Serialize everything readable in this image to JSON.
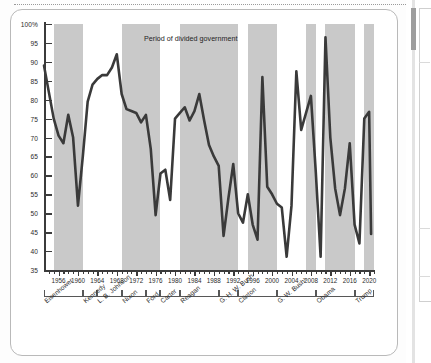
{
  "legend": {
    "swatch_color": "#c9c9c9",
    "label": "Period of divided government"
  },
  "colors": {
    "line": "#3a3a3a",
    "band": "#c9c9c9",
    "axis": "#3b3b3b",
    "card_border": "#b9b9b9"
  },
  "chart_data": {
    "type": "line",
    "title": "",
    "xlabel": "",
    "ylabel": "",
    "ylim": [
      35,
      100
    ],
    "xlim": [
      1953,
      2021
    ],
    "grid": false,
    "legend_position": "top-center",
    "y_ticks": [
      "35",
      "40",
      "45",
      "50",
      "55",
      "60",
      "65",
      "70",
      "75",
      "80",
      "85",
      "90",
      "95",
      "100%"
    ],
    "y_tick_values": [
      35,
      40,
      45,
      50,
      55,
      60,
      65,
      70,
      75,
      80,
      85,
      90,
      95,
      100
    ],
    "x_tick_labels": [
      "1956",
      "1960",
      "1964",
      "1968",
      "1972",
      "1976",
      "1980",
      "1984",
      "1988",
      "1992",
      "1996",
      "2000",
      "2004",
      "2008",
      "2012",
      "2016",
      "2020"
    ],
    "x_tick_values": [
      1956,
      1960,
      1964,
      1968,
      1972,
      1976,
      1980,
      1984,
      1988,
      1992,
      1996,
      2000,
      2004,
      2008,
      2012,
      2016,
      2020
    ],
    "series": [
      {
        "name": "Percentage",
        "x": [
          1953,
          1954,
          1955,
          1956,
          1957,
          1958,
          1959,
          1960,
          1961,
          1962,
          1963,
          1964,
          1965,
          1966,
          1967,
          1968,
          1969,
          1970,
          1971,
          1972,
          1973,
          1974,
          1975,
          1976,
          1977,
          1978,
          1979,
          1980,
          1981,
          1982,
          1983,
          1984,
          1985,
          1986,
          1987,
          1988,
          1989,
          1990,
          1991,
          1992,
          1993,
          1994,
          1995,
          1996,
          1997,
          1998,
          1999,
          2000,
          2001,
          2002,
          2003,
          2004,
          2005,
          2006,
          2007,
          2008,
          2009,
          2010,
          2011,
          2012,
          2013,
          2014,
          2015,
          2016,
          2017,
          2018,
          2019,
          2020
        ],
        "y": [
          89.0,
          82.0,
          75.0,
          70.5,
          68.5,
          76.0,
          70.0,
          52.0,
          65.0,
          79.5,
          84.0,
          85.5,
          86.5,
          86.5,
          88.5,
          92.0,
          81.5,
          77.5,
          77.0,
          76.5,
          74.0,
          76.0,
          67.0,
          49.5,
          60.5,
          61.5,
          53.5,
          75.0,
          76.5,
          78.0,
          74.5,
          77.0,
          81.5,
          74.5,
          68.0,
          65.0,
          62.5,
          44.0,
          54.0,
          63.0,
          50.0,
          47.5,
          55.0,
          47.0,
          43.0,
          86.0,
          57.0,
          55.0,
          52.5,
          51.5,
          38.5,
          52.0,
          87.5,
          72.0,
          76.5,
          81.0,
          61.0,
          38.5,
          96.5,
          70.0,
          56.5,
          49.5,
          56.5,
          68.5,
          47.0,
          42.0,
          75.0,
          76.8
        ],
        "last_value": 44.5
      }
    ],
    "divided_government_bands": [
      {
        "start": 1955,
        "end": 1961
      },
      {
        "start": 1969,
        "end": 1977
      },
      {
        "start": 1981,
        "end": 1993
      },
      {
        "start": 1995,
        "end": 2001
      },
      {
        "start": 2007,
        "end": 2009
      },
      {
        "start": 2011,
        "end": 2017
      },
      {
        "start": 2019,
        "end": 2021
      }
    ],
    "presidents": [
      {
        "name": "Eisenhower",
        "start": 1953,
        "end": 1961
      },
      {
        "name": "Kennedy",
        "start": 1961,
        "end": 1964
      },
      {
        "name": "L. B. Johnson",
        "start": 1964,
        "end": 1969
      },
      {
        "name": "Nixon",
        "start": 1969,
        "end": 1974
      },
      {
        "name": "Ford",
        "start": 1974,
        "end": 1977
      },
      {
        "name": "Carter",
        "start": 1977,
        "end": 1981
      },
      {
        "name": "Reagan",
        "start": 1981,
        "end": 1989
      },
      {
        "name": "G. H. W. Bush",
        "start": 1989,
        "end": 1993
      },
      {
        "name": "Clinton",
        "start": 1993,
        "end": 2001
      },
      {
        "name": "G. W. Bush¹",
        "start": 2001,
        "end": 2009
      },
      {
        "name": "Obama",
        "start": 2009,
        "end": 2017
      },
      {
        "name": "Trump",
        "start": 2017,
        "end": 2021
      }
    ]
  }
}
